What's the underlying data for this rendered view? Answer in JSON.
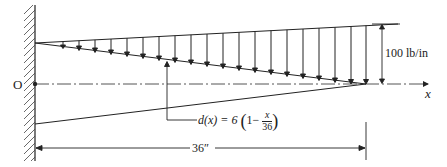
{
  "diagram": {
    "origin_label": "O",
    "axis_label": "x",
    "load_label": "100 lb/in",
    "depth_function": {
      "lhs": "d(x) = 6",
      "one_minus": "1−",
      "numerator": "x",
      "denominator": "36",
      "open_paren": "(",
      "close_paren": ")"
    },
    "length_label": "36″",
    "colors": {
      "line": "#222222",
      "background": "#ffffff"
    },
    "load": {
      "max_intensity_lb_per_in": 100,
      "distribution": "linearly increasing from 0 at wall to max at free end"
    },
    "beam": {
      "length_in": 36,
      "depth_at_wall_in": 6,
      "depth_at_end_in": 0,
      "support": "fixed wall at O"
    }
  }
}
